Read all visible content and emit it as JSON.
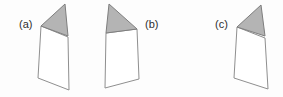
{
  "figure": {
    "background_color": "#fdfdfd",
    "line_color": "#8f8f8f",
    "flap_fill_color": "#b4b4b4",
    "flap_edge_color": "#7e7e7e",
    "label_color": "#2e2e2e",
    "panels": [
      {
        "label": "(a)",
        "label_side": "left",
        "flap_direction": "apex-up-right",
        "page_points": "41,26 68,37 69,90 38,78",
        "flap_points": "41,26 65,4 68,36"
      },
      {
        "label": "(b)",
        "label_side": "right",
        "flap_direction": "apex-up-left",
        "page_points": "106,33 137,29 139,79 105,88",
        "flap_points": "137,29 109,4 106,33"
      },
      {
        "label": "(c)",
        "label_side": "left",
        "flap_direction": "apex-up-right",
        "page_points": "237,27 265,38 268,89 234,78",
        "flap_points": "237,27 261,5 265,36"
      }
    ]
  }
}
